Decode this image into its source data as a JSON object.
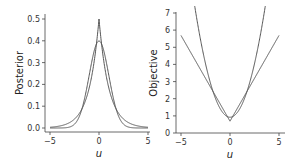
{
  "chart_data": [
    {
      "type": "line",
      "title": "",
      "xlabel": "u",
      "ylabel": "Posterior",
      "xlim": [
        -5.2,
        5.2
      ],
      "ylim": [
        -0.02,
        0.52
      ],
      "xticks": [
        "-5",
        "0",
        "5"
      ],
      "yticks": [
        "0.0",
        "0.1",
        "0.2",
        "0.3",
        "0.4",
        "0.5"
      ],
      "grid": false,
      "series": [
        {
          "name": "Gaussian",
          "formula": "N(0,1) pdf",
          "x": [
            -5,
            -4,
            -3,
            -2,
            -1,
            0,
            1,
            2,
            3,
            4,
            5
          ],
          "values": [
            0.0,
            0.0001,
            0.0044,
            0.054,
            0.242,
            0.399,
            0.242,
            0.054,
            0.0044,
            0.0001,
            0.0
          ]
        },
        {
          "name": "Laplace",
          "formula": "0.5*exp(-|u|)",
          "x": [
            -5,
            -4,
            -3,
            -2,
            -1,
            0,
            1,
            2,
            3,
            4,
            5
          ],
          "values": [
            0.0034,
            0.0092,
            0.0249,
            0.0677,
            0.184,
            0.5,
            0.184,
            0.0677,
            0.0249,
            0.0092,
            0.0034
          ]
        }
      ]
    },
    {
      "type": "line",
      "title": "",
      "xlabel": "u",
      "ylabel": "Objective",
      "xlim": [
        -5.2,
        5.2
      ],
      "ylim": [
        0,
        7
      ],
      "xticks": [
        "-5",
        "0",
        "5"
      ],
      "yticks": [
        "0",
        "1",
        "2",
        "3",
        "4",
        "5",
        "6",
        "7"
      ],
      "grid": false,
      "series": [
        {
          "name": "Gaussian (quadratic)",
          "formula": "u^2/2 + 0.92",
          "x": [
            -3.6,
            -3,
            -2,
            -1,
            0,
            1,
            2,
            3,
            3.6
          ],
          "values": [
            7.0,
            5.42,
            2.92,
            1.42,
            0.92,
            1.42,
            2.92,
            5.42,
            7.0
          ]
        },
        {
          "name": "Laplace (absolute)",
          "formula": "|u| + 0.69",
          "x": [
            -5,
            -4,
            -3,
            -2,
            -1,
            0,
            1,
            2,
            3,
            4,
            5
          ],
          "values": [
            5.69,
            4.69,
            3.69,
            2.69,
            1.69,
            0.69,
            1.69,
            2.69,
            3.69,
            4.69,
            5.69
          ]
        }
      ]
    }
  ],
  "left": {
    "ylabel": "Posterior",
    "xlabel": "u",
    "yticks": [
      "0.0",
      "0.1",
      "0.2",
      "0.3",
      "0.4",
      "0.5"
    ],
    "xticks": [
      "−5",
      "0",
      "5"
    ]
  },
  "right": {
    "ylabel": "Objective",
    "xlabel": "u",
    "yticks": [
      "0",
      "1",
      "2",
      "3",
      "4",
      "5",
      "6",
      "7"
    ],
    "xticks": [
      "−5",
      "0",
      "5"
    ]
  },
  "colors": {
    "line": "#555555",
    "axis": "#444444"
  }
}
